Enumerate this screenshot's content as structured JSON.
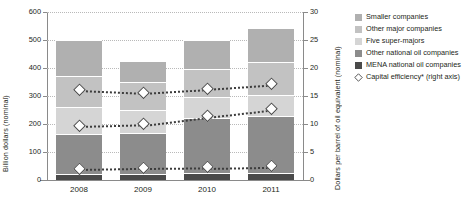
{
  "chart_data": {
    "type": "bar",
    "subtype": "stacked-bar-with-overlay-lines",
    "title": "",
    "categories": [
      "2008",
      "2009",
      "2010",
      "2011"
    ],
    "xlabel": "",
    "ylabel": "Billion dollars (nominal)",
    "ylabel_right": "Dollars per barrel of oil equivalent (nominal)",
    "ylim": [
      0,
      600
    ],
    "ylim_right": [
      0,
      30
    ],
    "yticks": [
      0,
      100,
      200,
      300,
      400,
      500,
      600
    ],
    "yticks_right": [
      0,
      5,
      10,
      15,
      20,
      25,
      30
    ],
    "grid": true,
    "legend_position": "right",
    "series": [
      {
        "name": "MENA national oil companies",
        "color": "#4a4a4a",
        "values": [
          22,
          20,
          24,
          26
        ]
      },
      {
        "name": "Other national oil companies",
        "color": "#8c8c8c",
        "values": [
          143,
          148,
          196,
          204
        ]
      },
      {
        "name": "Five super-majors",
        "color": "#d5d5d5",
        "values": [
          95,
          83,
          75,
          74
        ]
      },
      {
        "name": "Other major companies",
        "color": "#c2c2c2",
        "values": [
          110,
          98,
          100,
          116
        ]
      },
      {
        "name": "Smaller companies",
        "color": "#b0b0b0",
        "values": [
          129,
          75,
          104,
          124
        ]
      }
    ],
    "totals": [
      499,
      424,
      499,
      544
    ],
    "overlay_series": [
      {
        "name": "Capital efficiency* (upper)",
        "axis": "right",
        "marker": "diamond",
        "values": [
          16.0,
          15.5,
          16.2,
          17.0
        ]
      },
      {
        "name": "Capital efficiency* (middle)",
        "axis": "right",
        "marker": "diamond",
        "values": [
          9.6,
          9.9,
          11.3,
          12.6
        ]
      },
      {
        "name": "Capital efficiency* (lower)",
        "axis": "right",
        "marker": "diamond",
        "values": [
          1.9,
          2.1,
          2.2,
          2.4
        ]
      }
    ]
  },
  "legend": {
    "items": [
      {
        "label": "Smaller companies",
        "type": "swatch",
        "color": "#b0b0b0"
      },
      {
        "label": "Other major companies",
        "type": "swatch",
        "color": "#c2c2c2"
      },
      {
        "label": "Five super-majors",
        "type": "swatch",
        "color": "#d5d5d5"
      },
      {
        "label": "Other national oil companies",
        "type": "swatch",
        "color": "#8c8c8c"
      },
      {
        "label": "MENA national oil companies",
        "type": "swatch",
        "color": "#4a4a4a"
      },
      {
        "label": "Capital efficiency* (right axis)",
        "type": "diamond",
        "color": "#4a4a4a"
      }
    ]
  }
}
